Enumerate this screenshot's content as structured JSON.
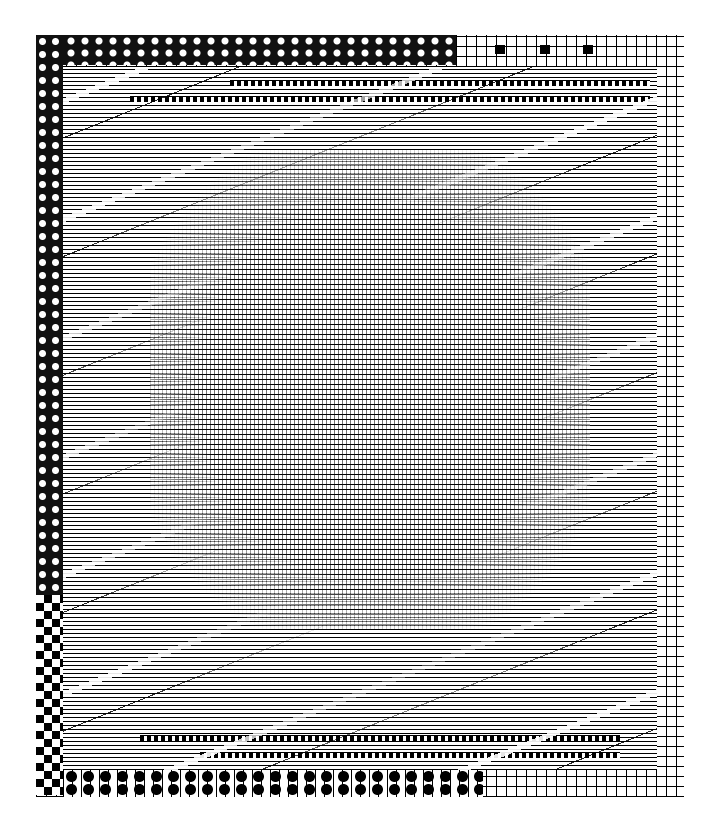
{
  "image": {
    "description": "Abstract black-and-white woven textile pattern with checkered and dotted border frame",
    "palette": {
      "ink": "#000000",
      "ground": "#ffffff"
    },
    "regions": [
      {
        "name": "top-left dotted border"
      },
      {
        "name": "right grid border"
      },
      {
        "name": "bottom dotted-checker border"
      },
      {
        "name": "central woven field"
      },
      {
        "name": "diagonal streak overlay"
      }
    ]
  }
}
